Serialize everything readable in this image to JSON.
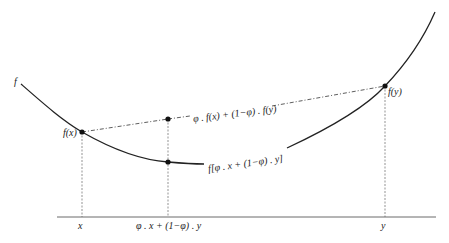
{
  "diagram": {
    "curve_label": "f",
    "point_labels": {
      "fx": "f(x)",
      "fy": "f(y)"
    },
    "chord_label": "φ . f(x) + (1−φ) . f(y)",
    "curve_point_label": "f[φ . x + (1−φ) . y]",
    "axis_labels": {
      "x": "x",
      "mid": "φ . x + (1−φ) . y",
      "y": "y"
    },
    "colors": {
      "line": "#222222",
      "dashed": "#555555"
    }
  }
}
